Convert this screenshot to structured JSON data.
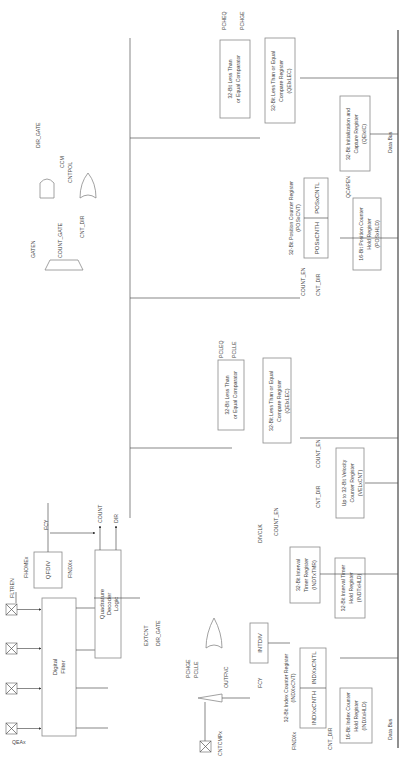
{
  "diagram": {
    "pins": [
      {
        "id": "qea",
        "label": "QEAx"
      },
      {
        "id": "qeb",
        "label": "QEBx"
      },
      {
        "id": "indx",
        "label": "INDXx"
      },
      {
        "id": "home",
        "label": "HOMEx"
      },
      {
        "id": "cntcmp",
        "label": "CNTCMPx"
      }
    ],
    "blocks": {
      "digital_filter": {
        "line1": "Digital",
        "line2": "Filter"
      },
      "qfdiv": {
        "label": "QFDIV",
        "symbol": "÷"
      },
      "quad_decoder": {
        "line1": "Quadrature",
        "line2": "Decoder",
        "line3": "Logic"
      },
      "intdiv": {
        "label": "INTDIV",
        "symbol": "÷"
      },
      "index_counter": {
        "title": "32-Bit Index Counter Register",
        "subtitle": "(INDXxCNT)",
        "high": "INDXxCNTH",
        "low": "INDXxCNTL"
      },
      "index_hold": {
        "line1": "16-Bit Index Counter",
        "line2": "Hold Register",
        "line3": "(INDXxHLD)"
      },
      "interval_timer": {
        "line1": "32-Bit Interval",
        "line2": "Timer Register",
        "line3": "(INDTxTMR)"
      },
      "interval_hold": {
        "line1": "32-Bit Interval Timer",
        "line2": "Hold Register",
        "line3": "(INDTxHLD)"
      },
      "velocity": {
        "line1": "Up to 32-Bit Velocity",
        "line2": "Counter Register",
        "line3": "(VELxCNT)"
      },
      "cmp_lec": {
        "line1": "32-Bit Less Than or Equal",
        "line2": "Compare Register",
        "line3": "(QEIxLEC)"
      },
      "cmp_lec_comp": {
        "line1": "32-Bit Less Than",
        "line2": "or Equal Comparator"
      },
      "pos_counter": {
        "title": "32-Bit Position Counter Register",
        "subtitle": "(POSxCNT)",
        "high": "POSxCNTH",
        "low": "POSxCNTL"
      },
      "pos_hold": {
        "line1": "16-Bit Position Counter",
        "line2": "Hold Register",
        "line3": "(POSxHLD)"
      },
      "init_capture": {
        "line1": "32-Bit Initialization and",
        "line2": "Capture Register",
        "line3": "(QEIxIC)"
      },
      "cmp_gec": {
        "line1": "32-Bit Less Than or Equal",
        "line2": "Compare Register",
        "line3": "(QEIxLEC)"
      },
      "cmp_gec_comp": {
        "line1": "32-Bit Less Than",
        "line2": "or Equal Comparator"
      }
    },
    "signals": {
      "flt_ren": "FLTREN",
      "home_out": "FHOMEx",
      "index_out": "FINDXx",
      "fcy": "FCY",
      "count": "COUNT",
      "dir": "DIR",
      "extcnt": "EXTCNT",
      "dir_gate": "DIR_GATE",
      "pclle": "PCLLE",
      "pchge": "PCHGE",
      "outfnc": "OUTFNC",
      "divclk": "DIVCLK",
      "count_en": "COUNT_EN",
      "cnt_dir": "CNT_DIR",
      "pcleq": "PCLEQ",
      "pcheq": "PCHEQ",
      "qcapen": "QCAPEN",
      "gaten": "GATEN",
      "count_gate": "COUNT_GATE",
      "ccm": "CCM",
      "cntpol": "CNTPOL",
      "mux_in_count": "COUNT",
      "mux_in_extcnt": "EXTCNT",
      "mux_in_divclk": "DIVCLK",
      "mux2_in_dir": "DIR",
      "mux2_in_dirgate": "DIR_GATE",
      "mux2_in_zero": "1'b0",
      "mux_sel_1": "1",
      "mux_sel_0": "0",
      "findx_in": "FINDXx",
      "cntdir_in": "CNT_DIR",
      "data_bus": "Data Bus"
    }
  }
}
